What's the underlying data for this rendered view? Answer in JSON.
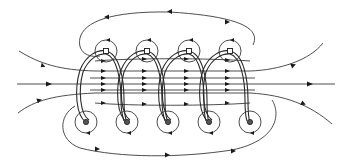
{
  "diagram": {
    "title": "Magnetic field lines of a solenoid",
    "turns": 4,
    "markers": {
      "top_squares_x": [
        106,
        147,
        189,
        230
      ],
      "top_y": 51,
      "bottom_dots_x": [
        86,
        127,
        168,
        209,
        250
      ],
      "bottom_y": 122
    },
    "field_direction": "left-to-right inside coil",
    "colors": {
      "line": "#3a3a3a",
      "background": "#ffffff"
    }
  }
}
